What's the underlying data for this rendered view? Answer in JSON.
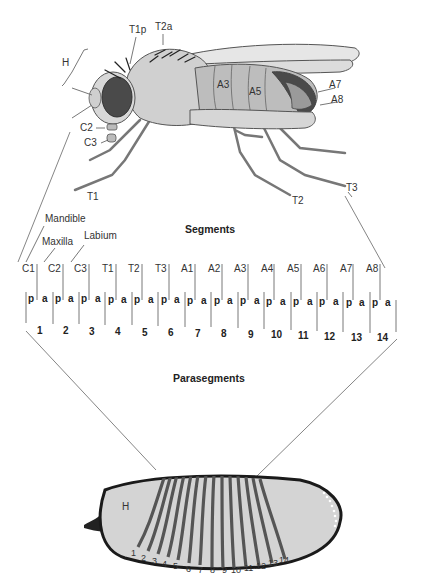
{
  "figure": {
    "fly_labels": {
      "head": "H",
      "t1p": "T1p",
      "t2a": "T2a",
      "a3": "A3",
      "a5": "A5",
      "a7": "A7",
      "a8": "A8",
      "c2": "C2",
      "c3": "C3",
      "t1": "T1",
      "t2": "T2",
      "t3": "T3"
    },
    "mouthparts": {
      "mandible": "Mandible",
      "maxilla": "Maxilla",
      "labium": "Labium"
    },
    "segments_title": "Segments",
    "segments": [
      "C1",
      "C2",
      "C3",
      "T1",
      "T2",
      "T3",
      "A1",
      "A2",
      "A3",
      "A4",
      "A5",
      "A6",
      "A7",
      "A8"
    ],
    "compartments": [
      "p",
      "a",
      "p",
      "a",
      "p",
      "a",
      "p",
      "a",
      "p",
      "a",
      "p",
      "a",
      "p",
      "a",
      "p",
      "a",
      "p",
      "a",
      "p",
      "a",
      "p",
      "a",
      "p",
      "a",
      "p",
      "a",
      "p",
      "a"
    ],
    "parasegments_title": "Parasegments",
    "parasegments": [
      "1",
      "2",
      "3",
      "4",
      "5",
      "6",
      "7",
      "8",
      "9",
      "10",
      "11",
      "12",
      "13",
      "14"
    ],
    "embryo": {
      "head_label": "H",
      "stripe_numbers": [
        "1",
        "2",
        "3",
        "4",
        "5",
        "6",
        "7",
        "8",
        "9",
        "10",
        "11",
        "12",
        "13",
        "14"
      ]
    }
  }
}
